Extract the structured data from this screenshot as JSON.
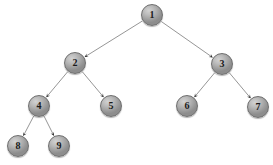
{
  "diagram": {
    "type": "binary-tree",
    "background_color": "#ffffff",
    "node_fill_color": "#a9a9a9",
    "node_border_color": "#6e6e6e",
    "edge_color": "#8a8a8a",
    "label_color": "#1a1a1a",
    "node_radius": 11,
    "nodes": [
      {
        "id": "n1",
        "label": "1",
        "cx": 152,
        "cy": 15,
        "r": 11
      },
      {
        "id": "n2",
        "label": "2",
        "cx": 75,
        "cy": 63,
        "r": 11
      },
      {
        "id": "n3",
        "label": "3",
        "cx": 222,
        "cy": 64,
        "r": 11
      },
      {
        "id": "n4",
        "label": "4",
        "cx": 39,
        "cy": 106,
        "r": 11
      },
      {
        "id": "n5",
        "label": "5",
        "cx": 111,
        "cy": 106,
        "r": 11
      },
      {
        "id": "n6",
        "label": "6",
        "cx": 187,
        "cy": 106,
        "r": 11
      },
      {
        "id": "n7",
        "label": "7",
        "cx": 258,
        "cy": 107,
        "r": 11
      },
      {
        "id": "n8",
        "label": "8",
        "cx": 18,
        "cy": 146,
        "r": 11
      },
      {
        "id": "n9",
        "label": "9",
        "cx": 59,
        "cy": 146,
        "r": 11
      }
    ],
    "edges": [
      {
        "id": "e1-2",
        "from": "n1",
        "to": "n2",
        "arrow": true
      },
      {
        "id": "e1-3",
        "from": "n1",
        "to": "n3",
        "arrow": true
      },
      {
        "id": "e2-4",
        "from": "n2",
        "to": "n4",
        "arrow": true
      },
      {
        "id": "e2-5",
        "from": "n2",
        "to": "n5",
        "arrow": true
      },
      {
        "id": "e3-6",
        "from": "n3",
        "to": "n6",
        "arrow": true
      },
      {
        "id": "e3-7",
        "from": "n3",
        "to": "n7",
        "arrow": true
      },
      {
        "id": "e4-8",
        "from": "n4",
        "to": "n8",
        "arrow": true
      },
      {
        "id": "e4-9",
        "from": "n4",
        "to": "n9",
        "arrow": true
      }
    ]
  }
}
